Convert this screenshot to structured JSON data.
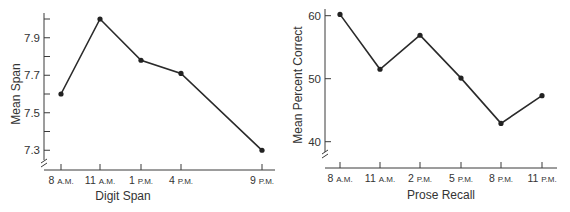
{
  "chart_data": [
    {
      "type": "line",
      "title": "",
      "xlabel": "Digit Span",
      "ylabel": "Mean Span",
      "categories": [
        "8 A.M.",
        "11 A.M.",
        "1 P.M.",
        "4 P.M.",
        "9 P.M."
      ],
      "x_tick_parts": [
        [
          "8",
          "A.M."
        ],
        [
          "11",
          "A.M."
        ],
        [
          "1",
          "P.M."
        ],
        [
          "4",
          "P.M."
        ],
        [
          "9",
          "P.M."
        ]
      ],
      "values": [
        7.6,
        8.0,
        7.78,
        7.71,
        7.3
      ],
      "ylim": [
        7.2,
        8.0
      ],
      "y_ticks": [
        7.3,
        7.4,
        7.5,
        7.6,
        7.7,
        7.8,
        7.9,
        8.0
      ],
      "y_tick_labels": [
        "7.3",
        "7.5",
        "7.7",
        "7.9"
      ],
      "axis_break": true,
      "grid": false,
      "legend": null
    },
    {
      "type": "line",
      "title": "",
      "xlabel": "Prose Recall",
      "ylabel": "Mean Percent Correct",
      "categories": [
        "8 A.M.",
        "11 A.M.",
        "2 P.M.",
        "5 P.M.",
        "8 P.M.",
        "11 P.M."
      ],
      "x_tick_parts": [
        [
          "8",
          "A.M."
        ],
        [
          "11",
          "A.M."
        ],
        [
          "2",
          "P.M."
        ],
        [
          "5",
          "P.M."
        ],
        [
          "8",
          "P.M."
        ],
        [
          "11",
          "P.M."
        ]
      ],
      "values": [
        60.2,
        51.5,
        56.9,
        50.1,
        42.9,
        47.3
      ],
      "ylim": [
        36,
        62
      ],
      "y_ticks": [
        40,
        50,
        60
      ],
      "y_tick_labels": [
        "40",
        "50",
        "60"
      ],
      "axis_break": true,
      "grid": false,
      "legend": null
    }
  ]
}
